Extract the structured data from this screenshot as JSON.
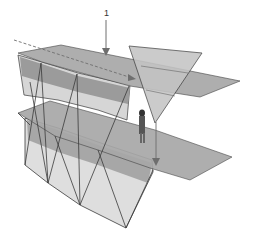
{
  "figure": {
    "type": "architectural-3d-diagram",
    "label_1": "1",
    "colors": {
      "background": "#ffffff",
      "facade_light": "#dcdcdc",
      "facade_mid": "#c8c8c8",
      "band_dark": "#9a9a9a",
      "plane_top": "#a9a9a9",
      "plane_lower": "#a6a6a6",
      "triangle": "#c2c2c2",
      "edge": "#3a3a3a",
      "arrow": "#6e6e6e"
    }
  }
}
